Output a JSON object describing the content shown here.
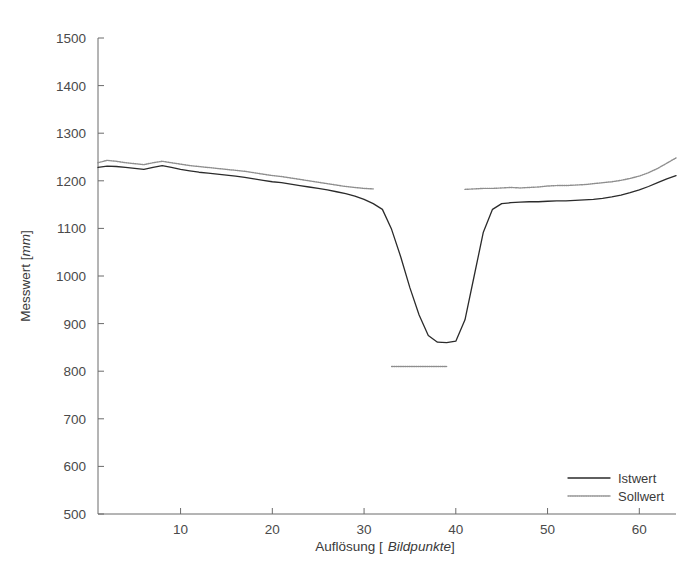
{
  "chart_data": {
    "type": "line",
    "title": "",
    "xlabel": "Auflösung [ Bildpunkte]",
    "xlabel_plain": "Auflösung [",
    "xlabel_italic": "Bildpunkte",
    "xlabel_tail": "]",
    "ylabel": "Messwert [mm]",
    "ylabel_plain": "Messwert [",
    "ylabel_italic": "mm",
    "ylabel_tail": "]",
    "xlim": [
      1,
      64
    ],
    "ylim": [
      500,
      1500
    ],
    "xticks": [
      10,
      20,
      30,
      40,
      50,
      60
    ],
    "yticks": [
      500,
      600,
      700,
      800,
      900,
      1000,
      1100,
      1200,
      1300,
      1400,
      1500
    ],
    "grid": false,
    "legend_position": "lower-right",
    "legend": [
      {
        "name": "Istwert",
        "color": "#2b2b2b",
        "style": "solid"
      },
      {
        "name": "Sollwert",
        "color": "#8e8e8e",
        "style": "dotted"
      }
    ],
    "series": [
      {
        "name": "Istwert",
        "color": "#2b2b2b",
        "style": "solid",
        "x": [
          1,
          2,
          3,
          4,
          5,
          6,
          7,
          8,
          9,
          10,
          11,
          12,
          13,
          14,
          15,
          16,
          17,
          18,
          19,
          20,
          21,
          22,
          23,
          24,
          25,
          26,
          27,
          28,
          29,
          30,
          31,
          32,
          33,
          34,
          35,
          36,
          37,
          38,
          39,
          40,
          41,
          42,
          43,
          44,
          45,
          46,
          47,
          48,
          49,
          50,
          51,
          52,
          53,
          54,
          55,
          56,
          57,
          58,
          59,
          60,
          61,
          62,
          63,
          64
        ],
        "y": [
          1228,
          1231,
          1230,
          1228,
          1226,
          1224,
          1228,
          1232,
          1228,
          1224,
          1221,
          1218,
          1216,
          1214,
          1212,
          1210,
          1207,
          1204,
          1201,
          1198,
          1196,
          1193,
          1190,
          1187,
          1184,
          1181,
          1177,
          1173,
          1168,
          1161,
          1152,
          1140,
          1098,
          1040,
          975,
          918,
          875,
          861,
          860,
          863,
          908,
          1000,
          1092,
          1140,
          1152,
          1154,
          1155,
          1156,
          1156,
          1157,
          1158,
          1158,
          1159,
          1160,
          1161,
          1163,
          1166,
          1170,
          1175,
          1181,
          1188,
          1196,
          1204,
          1211
        ]
      },
      {
        "name": "Sollwert",
        "color": "#8e8e8e",
        "style": "dotted",
        "segments": [
          {
            "x": [
              1,
              2,
              3,
              4,
              5,
              6,
              7,
              8,
              9,
              10,
              11,
              12,
              13,
              14,
              15,
              16,
              17,
              18,
              19,
              20,
              21,
              22,
              23,
              24,
              25,
              26,
              27,
              28,
              29,
              30,
              31
            ],
            "y": [
              1238,
              1243,
              1241,
              1238,
              1236,
              1234,
              1238,
              1241,
              1238,
              1235,
              1232,
              1230,
              1228,
              1226,
              1224,
              1222,
              1220,
              1217,
              1214,
              1211,
              1209,
              1206,
              1203,
              1200,
              1197,
              1194,
              1191,
              1188,
              1186,
              1184,
              1183
            ]
          },
          {
            "x": [
              33,
              34,
              35,
              36,
              37,
              38,
              39
            ],
            "y": [
              810,
              810,
              810,
              810,
              810,
              810,
              810
            ]
          },
          {
            "x": [
              41,
              42,
              43,
              44,
              45,
              46,
              47,
              48,
              49,
              50,
              51,
              52,
              53,
              54,
              55,
              56,
              57,
              58,
              59,
              60,
              61,
              62,
              63,
              64
            ],
            "y": [
              1182,
              1183,
              1184,
              1184,
              1185,
              1186,
              1185,
              1186,
              1187,
              1189,
              1190,
              1190,
              1191,
              1192,
              1194,
              1196,
              1198,
              1201,
              1205,
              1210,
              1217,
              1226,
              1237,
              1248
            ]
          }
        ]
      }
    ]
  }
}
